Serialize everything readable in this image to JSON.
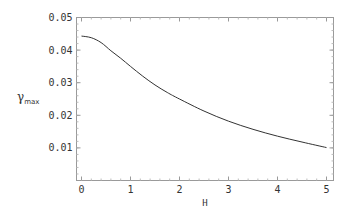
{
  "chart_data": {
    "type": "line",
    "title": "",
    "xlabel": "H",
    "ylabel": "γmax",
    "ylabel_main": "γ",
    "ylabel_sub": "max",
    "xlim": [
      0,
      5
    ],
    "ylim": [
      0,
      0.05
    ],
    "grid": false,
    "legend": null,
    "x_ticks": [
      0,
      1,
      2,
      3,
      4,
      5
    ],
    "x_tick_labels": [
      "0",
      "1",
      "2",
      "3",
      "4",
      "5"
    ],
    "y_ticks": [
      0.01,
      0.02,
      0.03,
      0.04,
      0.05
    ],
    "y_tick_labels": [
      "0.01",
      "0.02",
      "0.03",
      "0.04",
      "0.05"
    ],
    "series": [
      {
        "name": "γmax(H)",
        "color": "#333333",
        "x": [
          0,
          0.2,
          0.4,
          0.6,
          0.8,
          1.0,
          1.25,
          1.5,
          1.75,
          2.0,
          2.5,
          3.0,
          3.5,
          4.0,
          4.5,
          5.0
        ],
        "values": [
          0.0443,
          0.0438,
          0.0423,
          0.0398,
          0.0375,
          0.035,
          0.032,
          0.0293,
          0.027,
          0.025,
          0.0213,
          0.0182,
          0.0157,
          0.0136,
          0.0118,
          0.0101
        ]
      }
    ]
  },
  "colors": {
    "frame": "#9a9a9a",
    "curve": "#333333",
    "text": "#333333",
    "background": "#ffffff"
  }
}
